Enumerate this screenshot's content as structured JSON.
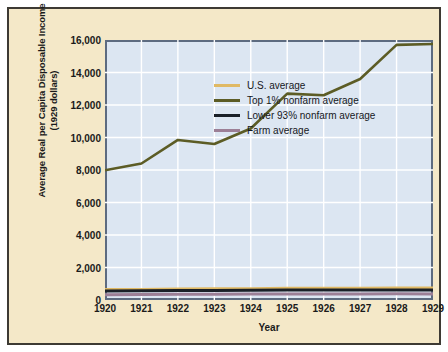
{
  "chart_data": {
    "type": "line",
    "title": "",
    "xlabel": "Year",
    "ylabel": "Average Real per Capita Disposable Income (1929 dollars)",
    "ylabel_line1": "Average Real per Capita Disposable Income",
    "ylabel_line2": "(1929 dollars)",
    "x": [
      1920,
      1921,
      1922,
      1923,
      1924,
      1925,
      1926,
      1927,
      1928,
      1929
    ],
    "categories": [
      "1920",
      "1921",
      "1922",
      "1923",
      "1924",
      "1925",
      "1926",
      "1927",
      "1928",
      "1929"
    ],
    "xlim": [
      1920,
      1929
    ],
    "ylim": [
      0,
      16000
    ],
    "yticks": [
      0,
      2000,
      4000,
      6000,
      8000,
      10000,
      12000,
      14000,
      16000
    ],
    "ytick_labels": [
      "0",
      "2,000",
      "4,000",
      "6,000",
      "8,000",
      "10,000",
      "12,000",
      "14,000",
      "16,000"
    ],
    "grid": true,
    "grid_color": "#ffffff",
    "legend_position": "upper left",
    "plot_background": "#dce6f2",
    "figure_background": "#f4e8c8",
    "series": [
      {
        "name": "U.S. average",
        "color": "#e0b964",
        "values": [
          640,
          650,
          670,
          690,
          700,
          720,
          720,
          730,
          740,
          745
        ]
      },
      {
        "name": "Top 1% nonfarm average",
        "color": "#5c5c25",
        "values": [
          7980,
          8400,
          9850,
          9600,
          10550,
          12700,
          12600,
          13600,
          15700,
          15750
        ]
      },
      {
        "name": "Lower 93% nonfarm average",
        "color": "#1a2028",
        "values": [
          560,
          565,
          585,
          590,
          600,
          615,
          610,
          615,
          620,
          620
        ]
      },
      {
        "name": "Farm average",
        "color": "#9c7f96",
        "values": [
          330,
          340,
          355,
          350,
          365,
          375,
          370,
          375,
          380,
          375
        ]
      }
    ]
  },
  "legend": {
    "items": [
      {
        "label": "U.S. average",
        "color": "#e0b964"
      },
      {
        "label": "Top 1% nonfarm average",
        "color": "#5c5c25"
      },
      {
        "label": "Lower 93% nonfarm average",
        "color": "#1a2028"
      },
      {
        "label": "Farm average",
        "color": "#9c7f96"
      }
    ]
  }
}
